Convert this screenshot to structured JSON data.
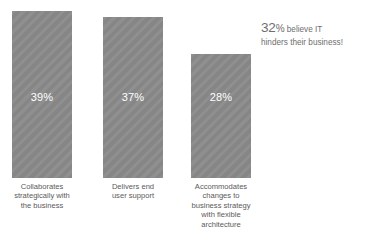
{
  "chart_data": {
    "type": "bar",
    "title": "",
    "subtitle": "",
    "xlabel": "",
    "ylabel": "",
    "grid": false,
    "legend": "none",
    "ylim": [
      0,
      43
    ],
    "categories": [
      "Collaborates strategically with the business",
      "Delivers end user support",
      "Accommodates changes to business strategy with flexible architecture"
    ],
    "values": [
      39,
      37,
      28
    ],
    "value_labels": [
      "39%",
      "37%",
      "28%"
    ],
    "bars": [
      {
        "value": 39,
        "value_label": "39%",
        "label_lines": [
          "Collaborates",
          "strategically with",
          "the business"
        ]
      },
      {
        "value": 37,
        "value_label": "37%",
        "label_lines": [
          "Delivers end",
          "user support"
        ]
      },
      {
        "value": 28,
        "value_label": "28%",
        "label_lines": [
          "Accommodates",
          "changes to",
          "business strategy",
          "with flexible",
          "architecture"
        ]
      }
    ],
    "annotations": [
      {
        "big": "32",
        "percent": "%",
        "rest": " believe IT",
        "line2": "hinders their business!"
      }
    ],
    "colors": {
      "bar_fill": "#8a8a8a",
      "value_text": "#ffffff",
      "category_text": "#5a5a5a",
      "annotation_text": "#6e6e6e",
      "background": "#ffffff"
    }
  }
}
